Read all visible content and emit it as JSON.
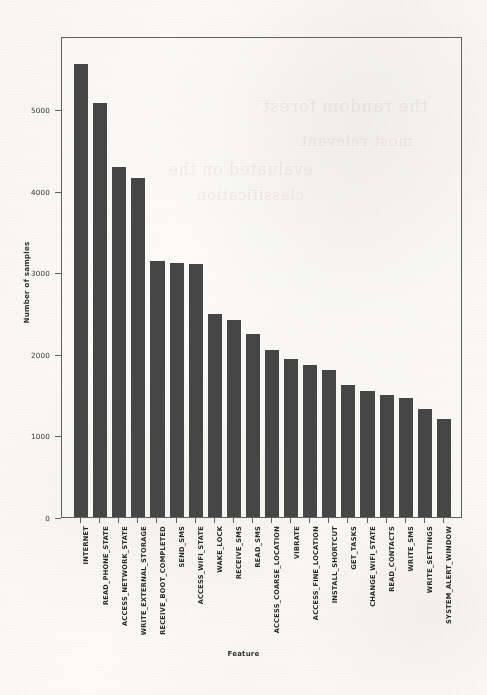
{
  "chart_data": {
    "type": "bar",
    "title": "",
    "xlabel": "Feature",
    "ylabel": "Number of samples",
    "ylim": [
      0,
      5900
    ],
    "yticks": [
      0,
      1000,
      2000,
      3000,
      4000,
      5000
    ],
    "ytick_labels": [
      "0",
      "1000",
      "2000",
      "3000",
      "4000",
      "5000"
    ],
    "grid": false,
    "legend": null,
    "bar_color": "#414141",
    "categories": [
      "INTERNET",
      "READ_PHONE_STATE",
      "ACCESS_NETWORK_STATE",
      "WRITE_EXTERNAL_STORAGE",
      "RECEIVE_BOOT_COMPLETED",
      "SEND_SMS",
      "ACCESS_WIFI_STATE",
      "WAKE_LOCK",
      "RECEIVE_SMS",
      "READ_SMS",
      "ACCESS_COARSE_LOCATION",
      "VIBRATE",
      "ACCESS_FINE_LOCATION",
      "INSTALL_SHORTCUT",
      "GET_TASKS",
      "CHANGE_WIFI_STATE",
      "READ_CONTACTS",
      "WRITE_SMS",
      "WRITE_SETTINGS",
      "SYSTEM_ALERT_WINDOW"
    ],
    "values": [
      5560,
      5080,
      4290,
      4160,
      3140,
      3110,
      3100,
      2490,
      2420,
      2250,
      2050,
      1940,
      1870,
      1800,
      1620,
      1540,
      1500,
      1460,
      1320,
      1200
    ]
  },
  "figure": {
    "ghost_text": [
      "the random forest",
      "evaluated on the",
      "most relevant",
      "classification"
    ]
  }
}
